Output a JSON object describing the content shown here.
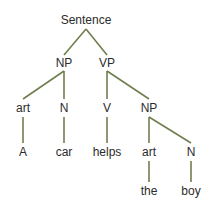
{
  "diagram": {
    "type": "syntax-tree",
    "edge_color": "#6f7f4f",
    "text_color": "#2b2b2b",
    "nodes": [
      {
        "id": "s",
        "label": "Sentence",
        "x": 86,
        "y": 20
      },
      {
        "id": "np1",
        "label": "NP",
        "x": 64,
        "y": 63
      },
      {
        "id": "vp",
        "label": "VP",
        "x": 107,
        "y": 63
      },
      {
        "id": "art1",
        "label": "art",
        "x": 23,
        "y": 108
      },
      {
        "id": "n1",
        "label": "N",
        "x": 64,
        "y": 108
      },
      {
        "id": "v",
        "label": "V",
        "x": 107,
        "y": 108
      },
      {
        "id": "np2",
        "label": "NP",
        "x": 149,
        "y": 108
      },
      {
        "id": "a",
        "label": "A",
        "x": 23,
        "y": 152
      },
      {
        "id": "car",
        "label": "car",
        "x": 64,
        "y": 152
      },
      {
        "id": "helps",
        "label": "helps",
        "x": 107,
        "y": 152
      },
      {
        "id": "art2",
        "label": "art",
        "x": 149,
        "y": 152
      },
      {
        "id": "n2",
        "label": "N",
        "x": 191,
        "y": 152
      },
      {
        "id": "the",
        "label": "the",
        "x": 149,
        "y": 191
      },
      {
        "id": "boy",
        "label": "boy",
        "x": 191,
        "y": 191
      }
    ],
    "edges": [
      {
        "from": "s",
        "to": "np1",
        "x1": 86,
        "y1": 29,
        "x2": 64,
        "y2": 55
      },
      {
        "from": "s",
        "to": "vp",
        "x1": 86,
        "y1": 29,
        "x2": 107,
        "y2": 55
      },
      {
        "from": "np1",
        "to": "art1",
        "x1": 64,
        "y1": 71,
        "x2": 23,
        "y2": 99
      },
      {
        "from": "np1",
        "to": "n1",
        "x1": 64,
        "y1": 71,
        "x2": 64,
        "y2": 99
      },
      {
        "from": "vp",
        "to": "v",
        "x1": 107,
        "y1": 71,
        "x2": 107,
        "y2": 99
      },
      {
        "from": "vp",
        "to": "np2",
        "x1": 107,
        "y1": 71,
        "x2": 149,
        "y2": 99
      },
      {
        "from": "art1",
        "to": "a",
        "x1": 23,
        "y1": 117,
        "x2": 23,
        "y2": 143
      },
      {
        "from": "n1",
        "to": "car",
        "x1": 64,
        "y1": 117,
        "x2": 64,
        "y2": 143
      },
      {
        "from": "v",
        "to": "helps",
        "x1": 107,
        "y1": 117,
        "x2": 107,
        "y2": 143
      },
      {
        "from": "np2",
        "to": "art2",
        "x1": 149,
        "y1": 117,
        "x2": 149,
        "y2": 143
      },
      {
        "from": "np2",
        "to": "n2",
        "x1": 149,
        "y1": 117,
        "x2": 191,
        "y2": 143
      },
      {
        "from": "art2",
        "to": "the",
        "x1": 149,
        "y1": 161,
        "x2": 149,
        "y2": 182
      },
      {
        "from": "n2",
        "to": "boy",
        "x1": 191,
        "y1": 161,
        "x2": 191,
        "y2": 182
      }
    ]
  }
}
